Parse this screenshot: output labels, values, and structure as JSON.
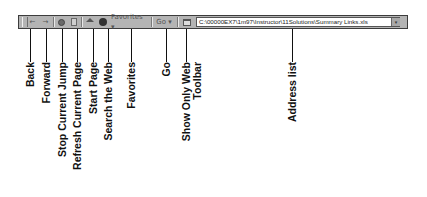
{
  "toolbar": {
    "back_icon": "←",
    "forward_icon": "→",
    "favorites_label": "Favorites ▾",
    "go_label": "Go ▾",
    "address_value": "C:\\00000EX7\\1m97\\Instructor\\11Solutions\\Summary Links.xls",
    "address_dropdown_icon": "▾"
  },
  "callouts": [
    {
      "id": "back",
      "label": "Back"
    },
    {
      "id": "forward",
      "label": "Forward"
    },
    {
      "id": "stop",
      "label": "Stop Current Jump"
    },
    {
      "id": "refresh",
      "label": "Refresh Current Page"
    },
    {
      "id": "start-page",
      "label": "Start Page"
    },
    {
      "id": "search",
      "label": "Search the Web"
    },
    {
      "id": "favorites",
      "label": "Favorites"
    },
    {
      "id": "go",
      "label": "Go"
    },
    {
      "id": "show-only-web",
      "label_line1": "Show Only Web",
      "label_line2": "Toolbar"
    },
    {
      "id": "address-list",
      "label": "Address list"
    }
  ],
  "colors": {
    "toolbar_bg": "#b4b4b4",
    "toolbar_border": "#3c3c3c",
    "label_text": "#111111"
  }
}
